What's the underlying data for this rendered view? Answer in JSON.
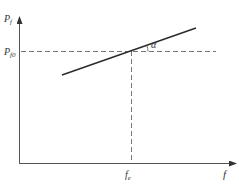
{
  "diagram": {
    "y_axis": {
      "label": "P",
      "label_sub": "f"
    },
    "x_axis": {
      "label": "f"
    },
    "reference_y": {
      "label": "P",
      "label_sub": "f0"
    },
    "reference_x": {
      "label": "f",
      "label_sub": "e"
    },
    "angle_label": "α",
    "colors": {
      "axis": "#555555",
      "line": "#2a2a2a",
      "dashed": "#777777",
      "text": "#333333"
    }
  }
}
